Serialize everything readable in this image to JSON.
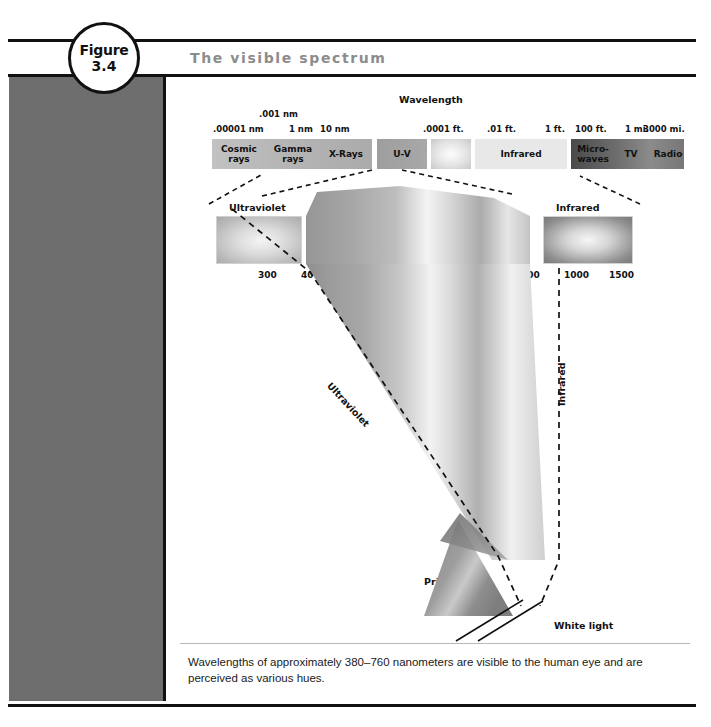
{
  "header": {
    "figure_word": "Figure",
    "figure_number": "3.4",
    "title": "The visible spectrum"
  },
  "caption": "Wavelengths of approximately 380–760 nanometers are visible to the human eye and are perceived as various hues.",
  "spectrum": {
    "heading": "Wavelength",
    "ticks": [
      {
        "label": ".00001 nm",
        "x": 213,
        "y": 124
      },
      {
        "label": ".001 nm",
        "x": 259,
        "y": 109
      },
      {
        "label": "1 nm",
        "x": 289,
        "y": 124
      },
      {
        "label": "10 nm",
        "x": 320,
        "y": 124
      },
      {
        "label": ".0001 ft.",
        "x": 423,
        "y": 124
      },
      {
        "label": ".01 ft.",
        "x": 487,
        "y": 124
      },
      {
        "label": "1 ft.",
        "x": 545,
        "y": 124
      },
      {
        "label": "100 ft.",
        "x": 575,
        "y": 124
      },
      {
        "label": "1 mi.",
        "x": 625,
        "y": 124
      },
      {
        "label": "3000 mi.",
        "x": 643,
        "y": 124
      }
    ],
    "bands": [
      {
        "name": "cosmic-rays",
        "label": "Cosmic\nrays",
        "lines": [
          "Cosmic",
          "rays"
        ]
      },
      {
        "name": "gamma-rays",
        "label": "Gamma\nrays",
        "lines": [
          "Gamma",
          "rays"
        ]
      },
      {
        "name": "x-rays",
        "label": "X-Rays",
        "lines": [
          "X-Rays"
        ]
      },
      {
        "name": "uv",
        "label": "U-V",
        "lines": [
          "U-V"
        ]
      },
      {
        "name": "visible",
        "label": "",
        "lines": []
      },
      {
        "name": "infrared",
        "label": "Infrared",
        "lines": [
          "Infrared"
        ]
      },
      {
        "name": "microwaves",
        "label": "Micro-\nwaves",
        "lines": [
          "Micro-",
          "waves"
        ]
      },
      {
        "name": "tv",
        "label": "TV",
        "lines": [
          "TV"
        ]
      },
      {
        "name": "radio",
        "label": "Radio",
        "lines": [
          "Radio"
        ]
      }
    ]
  },
  "detail": {
    "ultraviolet_label": "Ultraviolet",
    "visible_label": "Visible spectrum",
    "infrared_label": "Infrared",
    "axis_title": "Wavelength (nanometers)",
    "scale_numbers": [
      {
        "label": "300",
        "x": 258,
        "y": 270
      },
      {
        "label": "400",
        "x": 301,
        "y": 270
      },
      {
        "label": "500",
        "x": 379,
        "y": 270
      },
      {
        "label": "600",
        "x": 458,
        "y": 270
      },
      {
        "label": "700",
        "x": 521,
        "y": 270
      },
      {
        "label": "1000",
        "x": 564,
        "y": 270
      },
      {
        "label": "1500",
        "x": 609,
        "y": 270
      }
    ]
  },
  "diagram": {
    "ultraviolet_ray_label": "Ultraviolet",
    "infrared_ray_label": "Infrared",
    "prism_label": "Prism",
    "white_light_label": "White light"
  },
  "colors": {
    "left_panel": "#6e6e6e",
    "rule": "#111111",
    "title_gray": "#8c8c8c",
    "prism_fill": "#8a8a8a"
  }
}
